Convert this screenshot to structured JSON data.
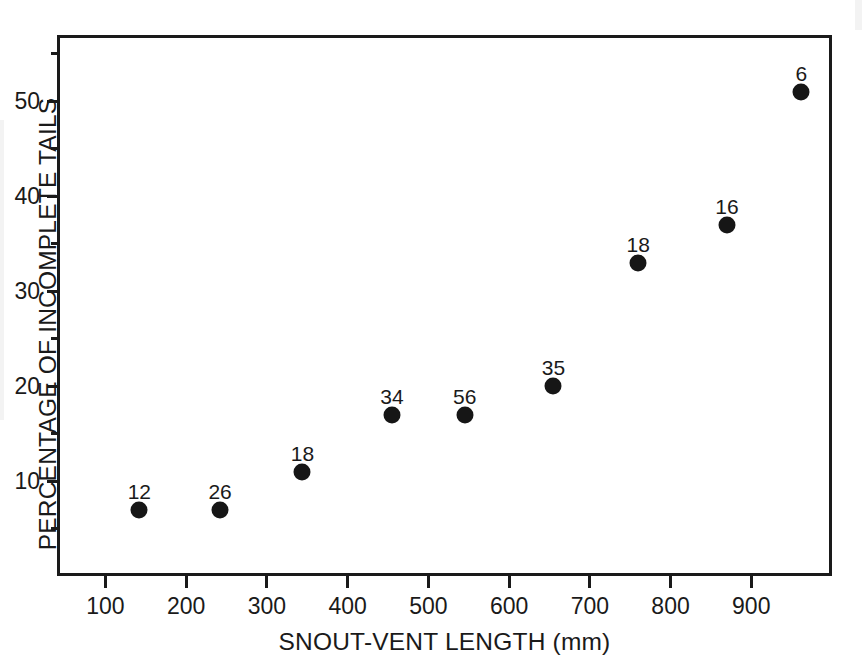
{
  "chart_data": {
    "type": "scatter",
    "title": "",
    "xlabel": "SNOUT-VENT LENGTH (mm)",
    "ylabel": "PERCENTAGE OF INCOMPLETE TAILS",
    "xlim": [
      40,
      1000
    ],
    "ylim": [
      0,
      57
    ],
    "grid": false,
    "legend": null,
    "xticks": [
      100,
      200,
      300,
      400,
      500,
      600,
      700,
      800,
      900
    ],
    "xtick_labels": [
      "100",
      "200",
      "300",
      "400",
      "500",
      "600",
      "700",
      "800",
      "900"
    ],
    "yticks": [
      10,
      20,
      30,
      40,
      50
    ],
    "ytick_labels": [
      "10",
      "20",
      "30",
      "40",
      "50"
    ],
    "yticks_minor": [
      5,
      15,
      25,
      35,
      45,
      55
    ],
    "point_labels_meaning": "sample size (n) printed above each point",
    "x": [
      142,
      242,
      344,
      455,
      545,
      655,
      760,
      870,
      962
    ],
    "y": [
      7,
      7,
      11,
      17,
      17,
      20,
      33,
      37,
      51
    ],
    "point_labels": [
      "12",
      "26",
      "18",
      "34",
      "56",
      "35",
      "18",
      "16",
      "6"
    ],
    "points": [
      {
        "x": 142,
        "y": 7,
        "label": "12"
      },
      {
        "x": 242,
        "y": 7,
        "label": "26"
      },
      {
        "x": 344,
        "y": 11,
        "label": "18"
      },
      {
        "x": 455,
        "y": 17,
        "label": "34"
      },
      {
        "x": 545,
        "y": 17,
        "label": "56"
      },
      {
        "x": 655,
        "y": 20,
        "label": "35"
      },
      {
        "x": 760,
        "y": 33,
        "label": "18"
      },
      {
        "x": 870,
        "y": 37,
        "label": "16"
      },
      {
        "x": 962,
        "y": 51,
        "label": "6"
      }
    ],
    "marker": {
      "shape": "circle",
      "color": "#161616",
      "size_px": 17
    },
    "axis_color": "#1a1a1a",
    "background": "#ffffff"
  }
}
